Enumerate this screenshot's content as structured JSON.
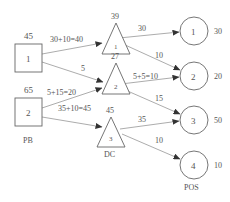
{
  "groups": {
    "pb": "PB",
    "dc": "DC",
    "pos": "POS"
  },
  "pb_nodes": [
    {
      "id": "1",
      "value": "45"
    },
    {
      "id": "2",
      "value": "65"
    }
  ],
  "dc_nodes": [
    {
      "id": "1",
      "value": "39"
    },
    {
      "id": "2",
      "value": "27"
    },
    {
      "id": "3",
      "value": "45"
    }
  ],
  "pos_nodes": [
    {
      "id": "1",
      "value": "30"
    },
    {
      "id": "2",
      "value": "20"
    },
    {
      "id": "3",
      "value": "50"
    },
    {
      "id": "4",
      "value": "10"
    }
  ],
  "edges": [
    {
      "from": "PB1",
      "to": "DC1",
      "label": "30+10=40"
    },
    {
      "from": "PB1",
      "to": "DC2",
      "label": "5"
    },
    {
      "from": "PB2",
      "to": "DC2",
      "label": "5+15=20"
    },
    {
      "from": "PB2",
      "to": "DC3",
      "label": "35+10=45"
    },
    {
      "from": "DC1",
      "to": "POS1",
      "label": "30"
    },
    {
      "from": "DC1",
      "to": "POS2",
      "label": "10"
    },
    {
      "from": "DC2",
      "to": "POS2",
      "label": "5+5=10"
    },
    {
      "from": "DC2",
      "to": "POS3",
      "label": "15"
    },
    {
      "from": "DC3",
      "to": "POS3",
      "label": "35"
    },
    {
      "from": "DC3",
      "to": "POS4",
      "label": "10"
    }
  ],
  "colors": {
    "stroke": "#666666",
    "edge": "#888888",
    "text": "#555555",
    "background": "#ffffff"
  }
}
